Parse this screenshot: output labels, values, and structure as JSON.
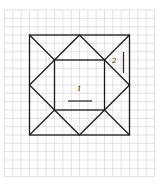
{
  "figure": {
    "grid": {
      "columns": 18,
      "rows": 20
    },
    "labels": [
      {
        "id": "region-1",
        "text": "1"
      },
      {
        "id": "region-2",
        "text": "2"
      }
    ],
    "colors": {
      "line": "#1a1a1a",
      "grid": "#d6d6d6",
      "background": "#ffffff"
    }
  }
}
